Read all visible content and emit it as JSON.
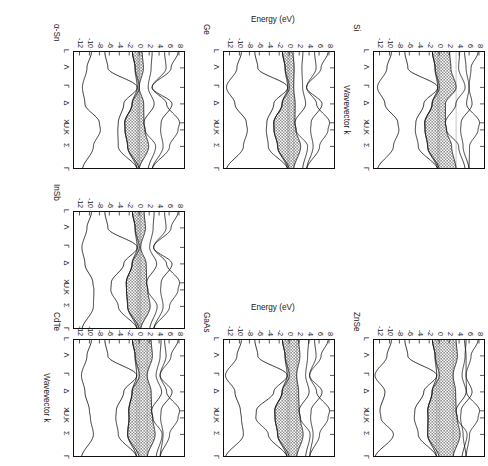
{
  "figure": {
    "orientation_note": "rotated-90-ccw",
    "axis_titles": {
      "y": "Energy (eV)",
      "x": "Wavevector k"
    },
    "y_ticks": [
      "8",
      "6",
      "4",
      "2",
      "0",
      "-2",
      "-4",
      "-6",
      "-8",
      "-10",
      "-12"
    ],
    "y_tick_values": [
      8,
      6,
      4,
      2,
      0,
      -2,
      -4,
      -6,
      -8,
      -10,
      -12
    ],
    "ylim": [
      -13.5,
      9.0
    ],
    "k_labels": [
      "L",
      "Λ",
      "Γ",
      "Δ",
      "X",
      "U,K",
      "Σ",
      "Γ"
    ],
    "k_positions": [
      0.0,
      0.135,
      0.3,
      0.44,
      0.6,
      0.66,
      0.8,
      1.0
    ]
  },
  "panels": [
    {
      "id": "si",
      "material": "Si",
      "show_y_ticks": true,
      "show_x_labels": true,
      "show_y_title": false,
      "show_x_title": true,
      "gap_fill": "#8f8f8f"
    },
    {
      "id": "ge",
      "material": "Ge",
      "show_y_ticks": true,
      "show_x_labels": true,
      "show_y_title": true,
      "show_x_title": false,
      "gap_fill": "#8f8f8f"
    },
    {
      "id": "asn",
      "material": "α-Sn",
      "show_y_ticks": true,
      "show_x_labels": true,
      "show_y_title": false,
      "show_x_title": false,
      "gap_fill": "#8f8f8f"
    },
    {
      "id": "znse",
      "material": "ZnSe",
      "show_y_ticks": true,
      "show_x_labels": true,
      "show_y_title": false,
      "show_x_title": false,
      "gap_fill": "#8f8f8f"
    },
    {
      "id": "gaas",
      "material": "GaAs",
      "show_y_ticks": true,
      "show_x_labels": true,
      "show_y_title": true,
      "show_x_title": false,
      "gap_fill": "#8f8f8f"
    },
    {
      "id": "cdte",
      "material": "CdTe",
      "show_y_ticks": true,
      "show_x_labels": true,
      "show_y_title": false,
      "show_x_title": true,
      "gap_fill": "#8f8f8f"
    },
    {
      "id": "insb",
      "material": "InSb",
      "show_y_ticks": true,
      "show_x_labels": true,
      "show_y_title": false,
      "show_x_title": false,
      "gap_fill": "#8f8f8f"
    }
  ],
  "chart_data": {
    "type": "line",
    "title": "",
    "xlabel": "Wavevector k",
    "ylabel": "Energy (eV)",
    "ylim": [
      -13.5,
      9.0
    ],
    "grid": false,
    "legend": "none",
    "xtick_labels": [
      "L",
      "Λ",
      "Γ",
      "Δ",
      "X",
      "U,K",
      "Σ",
      "Γ"
    ],
    "ytick_labels": [
      "8",
      "6",
      "4",
      "2",
      "0",
      "-2",
      "-4",
      "-6",
      "-8",
      "-10",
      "-12"
    ],
    "subplots": [
      {
        "name": "Si",
        "band_gap_eV": 1.1,
        "gap_type": "indirect",
        "valence_band_max_eV": 0.0,
        "conduction_band_min_eV": 1.1,
        "series": [
          {
            "name": "v1",
            "x": [
              0.0,
              0.135,
              0.3,
              0.44,
              0.6,
              0.66,
              0.8,
              1.0
            ],
            "values": [
              -9.6,
              -10.4,
              -12.4,
              -10.9,
              -8.3,
              -8.1,
              -9.0,
              -12.4
            ]
          },
          {
            "name": "v2",
            "x": [
              0.0,
              0.135,
              0.3,
              0.44,
              0.6,
              0.66,
              0.8,
              1.0
            ],
            "values": [
              -6.9,
              -6.2,
              -0.3,
              -3.0,
              -4.6,
              -4.7,
              -4.1,
              -0.3
            ]
          },
          {
            "name": "v3",
            "x": [
              0.0,
              0.135,
              0.3,
              0.44,
              0.6,
              0.66,
              0.8,
              1.0
            ],
            "values": [
              -1.3,
              -0.8,
              -0.3,
              -1.4,
              -2.8,
              -2.9,
              -2.3,
              -0.3
            ]
          },
          {
            "name": "v4",
            "x": [
              0.0,
              0.135,
              0.3,
              0.44,
              0.6,
              0.66,
              0.8,
              1.0
            ],
            "values": [
              -1.3,
              -0.8,
              0.0,
              -1.4,
              -2.8,
              -2.9,
              -2.3,
              0.0
            ]
          },
          {
            "name": "c1",
            "x": [
              0.0,
              0.135,
              0.3,
              0.44,
              0.6,
              0.66,
              0.8,
              1.0
            ],
            "values": [
              2.1,
              2.4,
              3.4,
              1.6,
              1.2,
              1.4,
              2.4,
              3.4
            ]
          },
          {
            "name": "c2",
            "x": [
              0.0,
              0.135,
              0.3,
              0.44,
              0.6,
              0.66,
              0.8,
              1.0
            ],
            "values": [
              4.2,
              4.1,
              3.4,
              3.8,
              1.2,
              1.4,
              3.8,
              3.4
            ]
          },
          {
            "name": "c3",
            "x": [
              0.0,
              0.135,
              0.3,
              0.44,
              0.6,
              0.66,
              0.8,
              1.0
            ],
            "values": [
              7.8,
              6.3,
              4.2,
              5.4,
              8.0,
              7.6,
              6.0,
              4.2
            ]
          }
        ]
      },
      {
        "name": "Ge",
        "band_gap_eV": 0.7,
        "gap_type": "indirect",
        "valence_band_max_eV": 0.0,
        "conduction_band_min_eV": 0.7
      },
      {
        "name": "α-Sn",
        "band_gap_eV": 0.0,
        "gap_type": "zero-gap",
        "valence_band_max_eV": 0.0,
        "conduction_band_min_eV": 0.0
      },
      {
        "name": "GaAs",
        "band_gap_eV": 1.4,
        "gap_type": "direct",
        "valence_band_max_eV": 0.0,
        "conduction_band_min_eV": 1.4
      },
      {
        "name": "ZnSe",
        "band_gap_eV": 2.7,
        "gap_type": "direct",
        "valence_band_max_eV": 0.0,
        "conduction_band_min_eV": 2.7
      },
      {
        "name": "InSb",
        "band_gap_eV": 0.2,
        "gap_type": "direct",
        "valence_band_max_eV": 0.0,
        "conduction_band_min_eV": 0.2
      },
      {
        "name": "CdTe",
        "band_gap_eV": 1.5,
        "gap_type": "direct",
        "valence_band_max_eV": 0.0,
        "conduction_band_min_eV": 1.5
      }
    ]
  }
}
